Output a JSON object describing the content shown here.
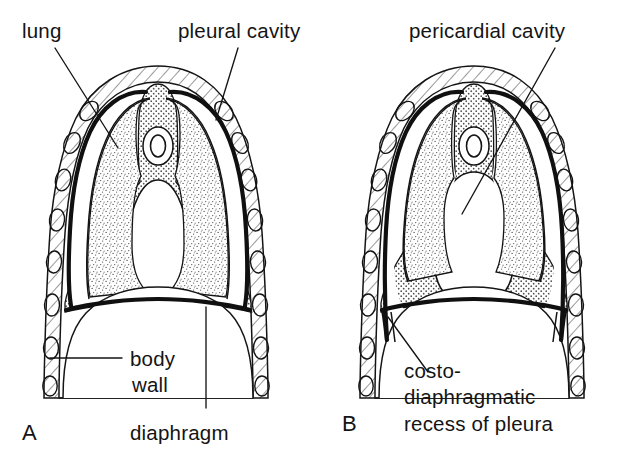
{
  "figure": {
    "type": "anatomical-line-diagram",
    "panels": [
      {
        "id": "A",
        "letter": "A",
        "labels": [
          {
            "key": "lung",
            "text": "lung"
          },
          {
            "key": "pleural_cavity",
            "text": "pleural cavity"
          },
          {
            "key": "body_wall_line1",
            "text": "body"
          },
          {
            "key": "body_wall_line2",
            "text": "wall"
          },
          {
            "key": "diaphragm",
            "text": "diaphragm"
          }
        ]
      },
      {
        "id": "B",
        "letter": "B",
        "labels": [
          {
            "key": "pericardial_cavity",
            "text": "pericardial cavity"
          },
          {
            "key": "recess_line1",
            "text": "costo-"
          },
          {
            "key": "recess_line2",
            "text": "diaphragmatic"
          },
          {
            "key": "recess_line3",
            "text": "recess of pleura"
          }
        ]
      }
    ],
    "text": {
      "lung": "lung",
      "pleural_cavity": "pleural cavity",
      "pericardial_cavity": "pericardial cavity",
      "body_wall_1": "body",
      "body_wall_2": "wall",
      "diaphragm": "diaphragm",
      "recess_1": "costo-",
      "recess_2": "diaphragmatic",
      "recess_3": "recess of pleura",
      "panel_a": "A",
      "panel_b": "B"
    },
    "colors": {
      "background": "#ffffff",
      "ink": "#141414",
      "stipple_lung": "#8a8a8a",
      "stipple_cavity": "#9a9a9a",
      "hatch_body_wall": "#5a5a5a"
    }
  }
}
